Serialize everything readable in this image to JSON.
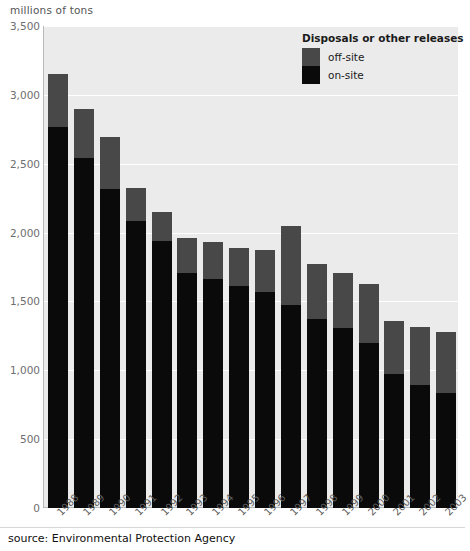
{
  "axis_unit_label": "millions of tons",
  "source_note": "source: Environmental Protection Agency",
  "legend": {
    "title": "Disposals or other releases",
    "items": [
      {
        "label": "off-site",
        "color": "#484848"
      },
      {
        "label": "on-site",
        "color": "#0a0a0a"
      }
    ]
  },
  "colors": {
    "plot_background": "#ebebeb",
    "gridline": "#ffffff",
    "axis": "#b9b9b9",
    "off_site": "#484848",
    "on_site": "#0a0a0a",
    "tick_text": "#6e6e6e",
    "page_background": "#ffffff"
  },
  "chart_data": {
    "type": "bar",
    "stacked": true,
    "title": "",
    "subtitle": "",
    "xlabel": "",
    "ylabel": "millions of tons",
    "ylim": [
      0,
      3500
    ],
    "ytick_labels": [
      "0",
      "500",
      "1,000",
      "1,500",
      "2,000",
      "2,500",
      "3,000",
      "3,500"
    ],
    "yticks": [
      0,
      500,
      1000,
      1500,
      2000,
      2500,
      3000,
      3500
    ],
    "grid": true,
    "legend_position": "top-right",
    "categories": [
      "1988",
      "1989",
      "1990",
      "1991",
      "1992",
      "1993",
      "1994",
      "1995",
      "1996",
      "1997",
      "1998",
      "1999",
      "2000",
      "2001",
      "2002",
      "2003"
    ],
    "series": [
      {
        "name": "on-site",
        "color": "#0a0a0a",
        "values": [
          2770,
          2545,
          2320,
          2085,
          1940,
          1705,
          1665,
          1610,
          1565,
          1475,
          1370,
          1305,
          1200,
          970,
          895,
          835
        ]
      },
      {
        "name": "off-site",
        "color": "#484848",
        "values": [
          380,
          355,
          375,
          240,
          210,
          255,
          265,
          280,
          310,
          575,
          400,
          405,
          430,
          385,
          420,
          440
        ]
      }
    ],
    "totals": [
      3150,
      2900,
      2695,
      2325,
      2150,
      1960,
      1930,
      1890,
      1875,
      2050,
      1770,
      1710,
      1630,
      1355,
      1315,
      1275
    ]
  }
}
